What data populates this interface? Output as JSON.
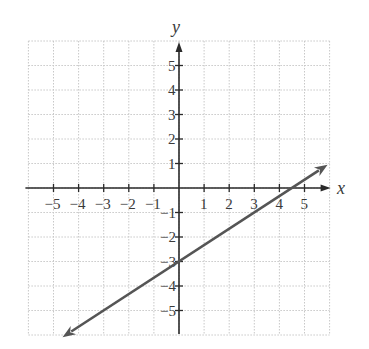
{
  "chart_data": {
    "type": "line",
    "title": "",
    "xlabel": "x",
    "ylabel": "y",
    "xlim": [
      -6,
      6
    ],
    "ylim": [
      -6,
      6
    ],
    "grid": true,
    "x_ticks": [
      -5,
      -4,
      -3,
      -2,
      -1,
      1,
      2,
      3,
      4,
      5
    ],
    "y_ticks": [
      5,
      4,
      3,
      2,
      1,
      -1,
      -2,
      -3,
      -4,
      -5
    ],
    "x_tick_labels": [
      "−5",
      "−4",
      "−3",
      "−2",
      "−1",
      "1",
      "2",
      "3",
      "4",
      "5"
    ],
    "y_tick_labels": [
      "5",
      "4",
      "3",
      "2",
      "1",
      "−1",
      "−2",
      "−3",
      "−4",
      "−5"
    ],
    "series": [
      {
        "name": "line",
        "equation": "y = (2/3)x - 3",
        "slope": 0.6667,
        "y_intercept": -3,
        "x_intercept": 4.5,
        "x": [
          -4.64,
          5.92
        ],
        "y": [
          -6.09,
          0.95
        ],
        "arrows": "both",
        "color": "#555555"
      }
    ],
    "legend": null
  },
  "colors": {
    "axis": "#2a2a2a",
    "grid": "#c8c8c8",
    "line": "#555555"
  }
}
